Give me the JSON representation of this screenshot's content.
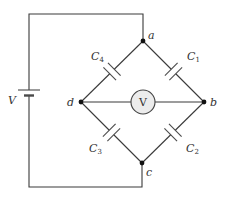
{
  "diagram": {
    "type": "capacitor-bridge-circuit",
    "source": {
      "label": "V",
      "kind": "battery"
    },
    "meter": {
      "label": "V",
      "kind": "voltmeter",
      "fill": "#ececec"
    },
    "nodes": [
      {
        "id": "a",
        "label": "a"
      },
      {
        "id": "b",
        "label": "b"
      },
      {
        "id": "c",
        "label": "c"
      },
      {
        "id": "d",
        "label": "d"
      }
    ],
    "capacitors": [
      {
        "id": "C1",
        "label": "C",
        "sub": "1",
        "between": [
          "a",
          "b"
        ]
      },
      {
        "id": "C2",
        "label": "C",
        "sub": "2",
        "between": [
          "b",
          "c"
        ]
      },
      {
        "id": "C3",
        "label": "C",
        "sub": "3",
        "between": [
          "c",
          "d"
        ]
      },
      {
        "id": "C4",
        "label": "C",
        "sub": "4",
        "between": [
          "d",
          "a"
        ]
      }
    ],
    "colors": {
      "wire": "#3a3a3a",
      "node": "#111111"
    }
  }
}
